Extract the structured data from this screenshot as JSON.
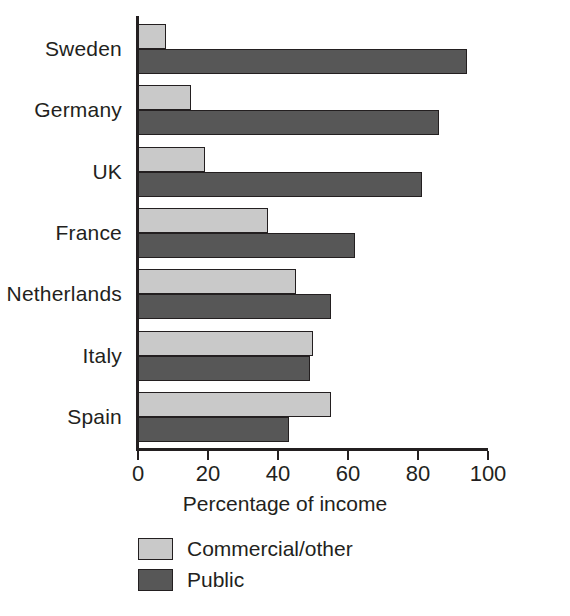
{
  "chart_data": {
    "type": "bar",
    "orientation": "horizontal",
    "title": "",
    "xlabel": "Percentage of income",
    "ylabel": "",
    "xlim": [
      0,
      100
    ],
    "xticks": [
      0,
      20,
      40,
      60,
      80,
      100
    ],
    "grid": false,
    "legend_position": "bottom-left",
    "categories": [
      "Sweden",
      "Germany",
      "UK",
      "France",
      "Netherlands",
      "Italy",
      "Spain"
    ],
    "series": [
      {
        "name": "Commercial/other",
        "color": "#c9c9c9",
        "values": [
          8,
          15,
          19,
          37,
          45,
          50,
          55
        ]
      },
      {
        "name": "Public",
        "color": "#575757",
        "values": [
          94,
          86,
          81,
          62,
          55,
          49,
          43
        ]
      }
    ]
  },
  "axis": {
    "tick_labels": [
      "0",
      "20",
      "40",
      "60",
      "80",
      "100"
    ],
    "title": "Percentage of income"
  },
  "legend": {
    "entries": [
      {
        "label": "Commercial/other",
        "swatch": "light"
      },
      {
        "label": "Public",
        "swatch": "dark"
      }
    ]
  },
  "colors": {
    "light_bar": "#c9c9c9",
    "dark_bar": "#575757",
    "outline": "#231f20",
    "background": "#ffffff"
  }
}
